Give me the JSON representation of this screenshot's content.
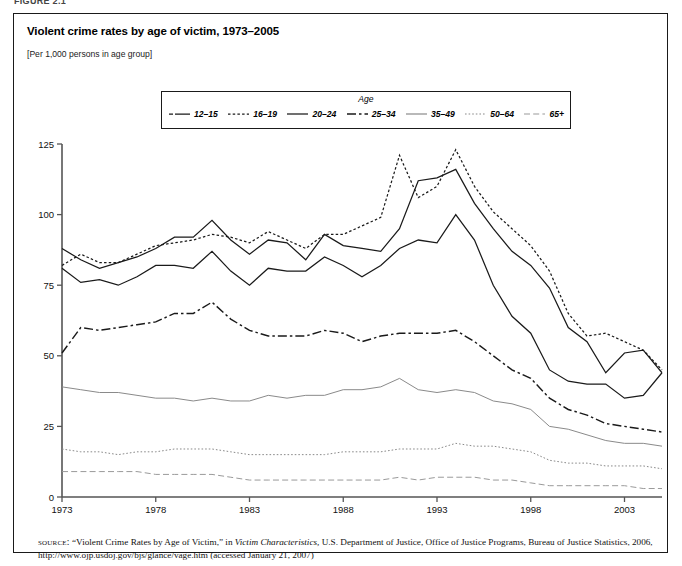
{
  "figure": {
    "label": "FIGURE 2.1"
  },
  "chart_title": "Violent crime rates by age of victim, 1973–2005",
  "chart_units": "[Per 1,000 persons in age group]",
  "legend": {
    "title": "Age",
    "items": [
      {
        "label": "12–15",
        "style": "long-dash-solid"
      },
      {
        "label": "16–19",
        "style": "dotted"
      },
      {
        "label": "20–24",
        "style": "solid"
      },
      {
        "label": "25–34",
        "style": "dash-dot"
      },
      {
        "label": "35–49",
        "style": "thin-solid"
      },
      {
        "label": "50–64",
        "style": "fine-dotted"
      },
      {
        "label": "65+",
        "style": "dashed"
      }
    ]
  },
  "source": {
    "label": "source:",
    "text_1": "“Violent Crime Rates by Age of Victim,” in ",
    "italic_1": "Victim Characteristics,",
    "text_2": " U.S. Department of Justice, Office of Justice Programs, Bureau of Justice Statistics, 2006, http://www.ojp.usdoj.gov/bjs/glance/vage.htm (accessed January 21, 2007)"
  },
  "chart_data": {
    "type": "line",
    "title": "Violent crime rates by age of victim, 1973–2005",
    "subtitle": "[Per 1,000 persons in age group]",
    "xlabel": "",
    "ylabel": "Rate per 1,000 persons in age group",
    "xlim": [
      1973,
      2005
    ],
    "ylim": [
      0,
      125
    ],
    "yticks": [
      0,
      25,
      50,
      75,
      100,
      125
    ],
    "xticks": [
      1973,
      1978,
      1983,
      1988,
      1993,
      1998,
      2003
    ],
    "grid": false,
    "legend_position": "top-center",
    "legend_title": "Age",
    "x": [
      1973,
      1974,
      1975,
      1976,
      1977,
      1978,
      1979,
      1980,
      1981,
      1982,
      1983,
      1984,
      1985,
      1986,
      1987,
      1988,
      1989,
      1990,
      1991,
      1992,
      1993,
      1994,
      1995,
      1996,
      1997,
      1998,
      1999,
      2000,
      2001,
      2002,
      2003,
      2004,
      2005
    ],
    "series": [
      {
        "name": "12–15",
        "values": [
          88,
          84,
          81,
          83,
          85,
          88,
          92,
          92,
          98,
          91,
          86,
          91,
          90,
          84,
          93,
          89,
          88,
          87,
          95,
          112,
          113,
          116,
          104,
          95,
          87,
          82,
          74,
          60,
          55,
          44,
          51,
          52,
          44
        ]
      },
      {
        "name": "16–19",
        "values": [
          82,
          86,
          83,
          83,
          86,
          89,
          90,
          91,
          93,
          92,
          90,
          94,
          91,
          88,
          93,
          93,
          96,
          99,
          121,
          106,
          110,
          123,
          110,
          101,
          95,
          89,
          80,
          65,
          57,
          58,
          55,
          52,
          45
        ]
      },
      {
        "name": "20–24",
        "values": [
          81,
          76,
          77,
          75,
          78,
          82,
          82,
          81,
          87,
          80,
          75,
          81,
          80,
          80,
          85,
          82,
          78,
          82,
          88,
          91,
          90,
          100,
          91,
          75,
          64,
          58,
          45,
          41,
          40,
          40,
          35,
          36,
          44
        ]
      },
      {
        "name": "25–34",
        "values": [
          51,
          60,
          59,
          60,
          61,
          62,
          65,
          65,
          69,
          63,
          59,
          57,
          57,
          57,
          59,
          58,
          55,
          57,
          58,
          58,
          58,
          59,
          55,
          50,
          45,
          42,
          35,
          31,
          29,
          26,
          25,
          24,
          23
        ]
      },
      {
        "name": "35–49",
        "values": [
          39,
          38,
          37,
          37,
          36,
          35,
          35,
          34,
          35,
          34,
          34,
          36,
          35,
          36,
          36,
          38,
          38,
          39,
          42,
          38,
          37,
          38,
          37,
          34,
          33,
          31,
          25,
          24,
          22,
          20,
          19,
          19,
          18
        ]
      },
      {
        "name": "50–64",
        "values": [
          17,
          16,
          16,
          15,
          16,
          16,
          17,
          17,
          17,
          16,
          15,
          15,
          15,
          15,
          15,
          16,
          16,
          16,
          17,
          17,
          17,
          19,
          18,
          18,
          17,
          16,
          13,
          12,
          12,
          11,
          11,
          11,
          10
        ]
      },
      {
        "name": "65+",
        "values": [
          9,
          9,
          9,
          9,
          9,
          8,
          8,
          8,
          8,
          7,
          6,
          6,
          6,
          6,
          6,
          6,
          6,
          6,
          7,
          6,
          7,
          7,
          7,
          6,
          6,
          5,
          4,
          4,
          4,
          4,
          4,
          3,
          3
        ]
      }
    ]
  }
}
